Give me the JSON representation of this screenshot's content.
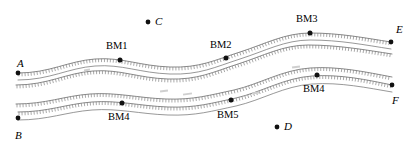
{
  "figure": {
    "type": "geologic-sketch-map",
    "width": 415,
    "height": 148,
    "background_color": "#ffffff",
    "line_color": "#6b6b6b",
    "hachure_color": "#7a7a7a",
    "marker_color": "#111111",
    "text_color": "#000000"
  },
  "points": [
    {
      "id": "A",
      "label": "A",
      "kind": "endpoint",
      "x": 18,
      "y": 73,
      "label_x": 17,
      "label_y": 58,
      "style": "italic",
      "marker": true
    },
    {
      "id": "B",
      "label": "B",
      "kind": "endpoint",
      "x": 18,
      "y": 118,
      "label_x": 15,
      "label_y": 130,
      "style": "italic",
      "marker": true
    },
    {
      "id": "C",
      "label": "C",
      "kind": "reference",
      "x": 148,
      "y": 22,
      "label_x": 155,
      "label_y": 16,
      "style": "italic",
      "marker": true
    },
    {
      "id": "D",
      "label": "D",
      "kind": "reference",
      "x": 277,
      "y": 127,
      "label_x": 284,
      "label_y": 121,
      "style": "italic",
      "marker": true
    },
    {
      "id": "E",
      "label": "E",
      "kind": "endpoint",
      "x": 391,
      "y": 42,
      "label_x": 396,
      "label_y": 24,
      "style": "italic",
      "marker": true
    },
    {
      "id": "F",
      "label": "F",
      "kind": "endpoint",
      "x": 392,
      "y": 85,
      "label_x": 392,
      "label_y": 95,
      "style": "italic",
      "marker": true
    },
    {
      "id": "BM1",
      "label": "BM1",
      "kind": "benchmark",
      "x": 120,
      "y": 60,
      "label_x": 106,
      "label_y": 41,
      "style": "bm",
      "marker": true
    },
    {
      "id": "BM2",
      "label": "BM2",
      "kind": "benchmark",
      "x": 226,
      "y": 58,
      "label_x": 210,
      "label_y": 40,
      "style": "bm",
      "marker": true
    },
    {
      "id": "BM3",
      "label": "BM3",
      "kind": "benchmark",
      "x": 310,
      "y": 33,
      "label_x": 296,
      "label_y": 14,
      "style": "bm",
      "marker": true
    },
    {
      "id": "BM4u",
      "label": "BM4",
      "kind": "benchmark",
      "x": 317,
      "y": 75,
      "label_x": 303,
      "label_y": 84,
      "style": "bm",
      "marker": true
    },
    {
      "id": "BM4l",
      "label": "BM4",
      "kind": "benchmark",
      "x": 122,
      "y": 103,
      "label_x": 108,
      "label_y": 112,
      "style": "bm",
      "marker": true
    },
    {
      "id": "BM5",
      "label": "BM5",
      "kind": "benchmark",
      "x": 231,
      "y": 100,
      "label_x": 217,
      "label_y": 110,
      "style": "bm",
      "marker": true
    }
  ],
  "bands": [
    {
      "id": "upper-band",
      "name": "upper-fault-scarp",
      "hachured_line": "M 18 73 C 50 73 68 61 95 59 C 122 57 140 66 170 67 C 200 68 215 60 240 52 C 265 44 285 33 310 33 C 340 33 365 38 391 42",
      "base_line": "M 18 80 C 50 80 68 68 95 66 C 122 64 140 73 170 74 C 200 75 215 67 240 59 C 265 51 285 40 310 40 C 340 40 365 45 391 49",
      "hachure_side": "down"
    },
    {
      "id": "upper-band-lower-edge",
      "name": "upper-scarp-toe",
      "hachured_line": "M 16 85 C 48 85 66 73 93 71 C 120 69 138 78 168 79 C 198 80 213 72 238 64 C 263 56 283 45 308 45 C 338 45 366 50 392 54",
      "base_line": null,
      "hachure_side": "down"
    },
    {
      "id": "lower-band",
      "name": "lower-fault-scarp",
      "hachured_line": "M 18 112 C 48 112 66 104 92 102 C 118 100 140 106 168 107 C 196 108 212 103 236 98 C 262 92 284 78 312 76 C 340 74 368 80 392 85",
      "base_line": "M 18 120 C 48 120 66 112 92 110 C 118 108 140 114 168 115 C 196 116 212 111 236 106 C 262 100 284 86 312 84 C 340 82 368 88 392 92",
      "hachure_side": "down"
    },
    {
      "id": "lower-band-upper-edge",
      "name": "lower-scarp-crest",
      "hachured_line": "M 16 104 C 46 104 64 96 90 94 C 116 92 138 98 166 99 C 194 100 210 95 234 90 C 260 84 282 70 310 68 C 338 66 366 72 392 77",
      "base_line": null,
      "hachure_side": "down"
    }
  ],
  "faint_marks": [
    {
      "id": "m1",
      "x": 160,
      "y": 90,
      "w": 8,
      "h": 2
    },
    {
      "id": "m2",
      "x": 183,
      "y": 93,
      "w": 9,
      "h": 2
    },
    {
      "id": "m3",
      "x": 252,
      "y": 92,
      "w": 7,
      "h": 2
    },
    {
      "id": "m4",
      "x": 292,
      "y": 66,
      "w": 8,
      "h": 2
    },
    {
      "id": "m5",
      "x": 84,
      "y": 69,
      "w": 6,
      "h": 2
    }
  ]
}
